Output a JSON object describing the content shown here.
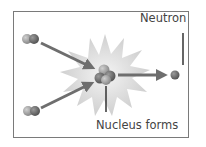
{
  "diagram": {
    "labels": {
      "neutron": "Neutron",
      "nucleus": "Nucleus forms"
    },
    "nodes": [
      {
        "id": "reactant-top",
        "type": "two-particle nucleus"
      },
      {
        "id": "reactant-bottom",
        "type": "two-particle nucleus"
      },
      {
        "id": "product-nucleus",
        "type": "four-particle nucleus"
      },
      {
        "id": "neutron",
        "type": "single particle"
      }
    ],
    "edges": [
      {
        "from": "reactant-top",
        "to": "product-nucleus"
      },
      {
        "from": "reactant-bottom",
        "to": "product-nucleus"
      },
      {
        "from": "product-nucleus",
        "to": "neutron"
      }
    ],
    "colors": {
      "border": "#7a7a7a",
      "arrow": "#6e6e6e",
      "burst": "#d8d8d8",
      "particle_dark": "#6a6a6a",
      "particle_light": "#a8a8a8",
      "text": "#444444"
    }
  }
}
